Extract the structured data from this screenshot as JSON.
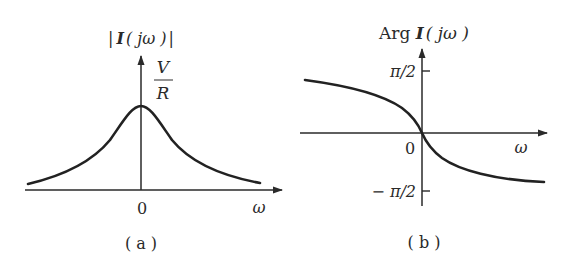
{
  "figure": {
    "panel_a": {
      "caption": "( a )",
      "y_label": {
        "open": "|",
        "bold": "I",
        "arg": "( jω )",
        "close": "|"
      },
      "peak_label": {
        "numerator": "V",
        "denominator": "R"
      },
      "origin_label": "0",
      "x_label": "ω",
      "curve": "magnitude, symmetric bell shape peaking at V/R at ω = 0"
    },
    "panel_b": {
      "caption": "( b )",
      "y_label": {
        "prefix": "Arg ",
        "bold": "I",
        "arg": "( jω )"
      },
      "upper_tick": "π/2",
      "lower_tick": "− π/2",
      "origin_label": "0",
      "x_label": "ω",
      "curve": "phase, decreasing from near π/2 through 0 at ω = 0 toward −π/2"
    },
    "colors": {
      "ink": "#2a2a2a",
      "background": "#ffffff"
    }
  }
}
